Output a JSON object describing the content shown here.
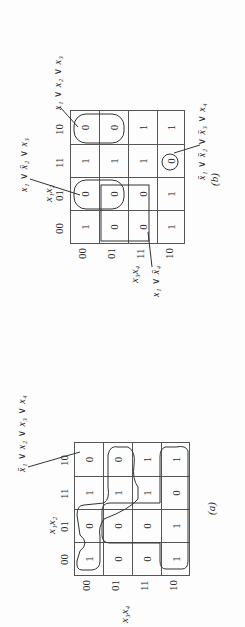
{
  "figure": {
    "orientation": "rotated 90 degrees counter-clockwise",
    "maps": [
      {
        "id": "a",
        "caption": "(a)",
        "col_var": "x1x2",
        "row_var": "x3x4",
        "col_labels": [
          "00",
          "01",
          "11",
          "10"
        ],
        "row_labels": [
          "00",
          "01",
          "11",
          "10"
        ],
        "cells": [
          [
            "1",
            "0",
            "1",
            "0"
          ],
          [
            "0",
            "0",
            "1",
            "0"
          ],
          [
            "0",
            "0",
            "1",
            "1"
          ],
          [
            "1",
            "1",
            "0",
            "1"
          ]
        ],
        "annotations": [
          {
            "text": "x̄1 ∨ x2 ∨ x3 ∨ x4",
            "points_to": "row 00, col 10"
          }
        ],
        "groupings": [
          "outline of 1-cells (upper-left region)",
          "outline of 1-cells (lower U region)"
        ]
      },
      {
        "id": "b",
        "caption": "(b)",
        "col_var": "x1x2",
        "row_var": "x3x4",
        "col_labels": [
          "00",
          "01",
          "11",
          "10"
        ],
        "row_labels": [
          "00",
          "01",
          "11",
          "10"
        ],
        "cells": [
          [
            "1",
            "0",
            "1",
            "0"
          ],
          [
            "0",
            "0",
            "1",
            "0"
          ],
          [
            "0",
            "0",
            "1",
            "1"
          ],
          [
            "1",
            "1",
            "0",
            "1"
          ]
        ],
        "annotations": [
          {
            "text": "x1 ∨ x̄2 ∨ x3",
            "points_to": "col 01, rows 00-01"
          },
          {
            "text": "x1 ∨ x2 ∨ x3",
            "points_to": "col 10, rows 00-01"
          },
          {
            "text": "x̄1 ∨ x̄2 ∨ x̄3 ∨ x4",
            "points_to": "row 10, col 11"
          },
          {
            "text": "x1 ∨ x̄4",
            "points_to": "rows 01-11, cols 00-01"
          }
        ]
      }
    ]
  },
  "text": {
    "a": {
      "caption": "(a)",
      "col_var": "x₁x₂",
      "row_var": "x₃x₄",
      "formula": [
        "x̄₁",
        "∨",
        "x₂",
        "∨",
        "x₃",
        "∨",
        "x₄"
      ]
    },
    "b": {
      "caption": "(b)",
      "col_var": "x₁x₂",
      "row_var": "x₃x₄",
      "f1": [
        "x₁",
        "∨",
        "x̄₂",
        "∨",
        "x₃"
      ],
      "f2": [
        "x₁",
        "∨",
        "x₂",
        "∨",
        "x₃"
      ],
      "f3": [
        "x̄₁",
        "∨",
        "x̄₂",
        "∨",
        "x̄₃",
        "∨",
        "x₄"
      ],
      "f4": [
        "x₁",
        "∨",
        "x̄₄"
      ]
    },
    "labels": [
      "00",
      "01",
      "11",
      "10"
    ],
    "a_cells": [
      "1",
      "0",
      "1",
      "0",
      "0",
      "0",
      "1",
      "0",
      "0",
      "0",
      "1",
      "1",
      "1",
      "1",
      "0",
      "1"
    ],
    "b_cells": [
      "1",
      "0",
      "1",
      "0",
      "0",
      "0",
      "1",
      "0",
      "0",
      "0",
      "1",
      "1",
      "1",
      "1",
      "0",
      "1"
    ]
  }
}
